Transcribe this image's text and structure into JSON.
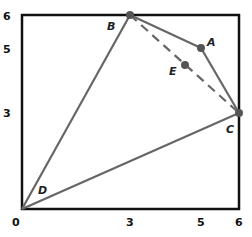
{
  "figure": {
    "axes": {
      "x_ticks": [
        "0",
        "3",
        "5",
        "6"
      ],
      "y_ticks": [
        "6",
        "5",
        "3"
      ],
      "x_range": [
        0,
        6
      ],
      "y_range": [
        0,
        6
      ]
    },
    "points": {
      "A": {
        "label": "A",
        "x": 5,
        "y": 5
      },
      "B": {
        "label": "B",
        "x": 3,
        "y": 6
      },
      "C": {
        "label": "C",
        "x": 6,
        "y": 3
      },
      "D": {
        "label": "D",
        "x": 0,
        "y": 0
      },
      "E": {
        "label": "E",
        "x": 4.5,
        "y": 4.5
      }
    },
    "segments": [
      {
        "from": "D",
        "to": "B",
        "style": "solid"
      },
      {
        "from": "B",
        "to": "A",
        "style": "solid"
      },
      {
        "from": "A",
        "to": "C",
        "style": "solid"
      },
      {
        "from": "C",
        "to": "D",
        "style": "solid"
      },
      {
        "from": "B",
        "to": "C",
        "style": "dashed"
      }
    ],
    "colors": {
      "frame": "#111111",
      "lines": "#666666",
      "points": "#555555"
    }
  }
}
